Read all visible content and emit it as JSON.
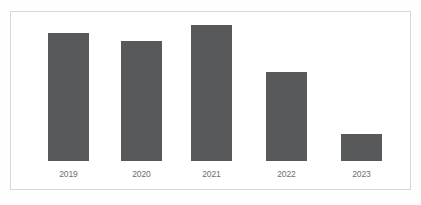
{
  "chart_data": {
    "type": "bar",
    "title": "",
    "subtitle": "",
    "xlabel": "",
    "ylabel": "",
    "grid": false,
    "legend": false,
    "axis_visible": false,
    "ylim": [
      0,
      4.17
    ],
    "decimal_separator": ",",
    "bar_color": "#58595b",
    "value_label_color": "#ffffff",
    "category_label_color": "#6e6e6e",
    "frame_color": "#d8d8d8",
    "background_color": "#ffffff",
    "categories": [
      "2019",
      "2020",
      "2021",
      "2022",
      "2023"
    ],
    "values": [
      3.92,
      3.68,
      4.17,
      2.73,
      0.82
    ],
    "value_labels": [
      "3,92",
      "3,68",
      "4,17",
      "2,73",
      "0,82"
    ]
  },
  "bars": [
    {
      "category": "2019",
      "value_label": "3,92"
    },
    {
      "category": "2020",
      "value_label": "3,68"
    },
    {
      "category": "2021",
      "value_label": "4,17"
    },
    {
      "category": "2022",
      "value_label": "2,73"
    },
    {
      "category": "2023",
      "value_label": "0,82"
    }
  ]
}
